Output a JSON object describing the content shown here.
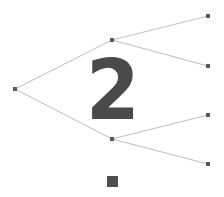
{
  "diagram": {
    "type": "binary-tree",
    "center_label": "2",
    "colors": {
      "edge": "#bdbdbd",
      "node": "#5a5a5a",
      "label": "#4a4a4a",
      "square": "#4f4f4f",
      "background": "#ffffff"
    },
    "nodes": [
      {
        "id": "root",
        "x": 15,
        "y": 89
      },
      {
        "id": "mid-top",
        "x": 112,
        "y": 40
      },
      {
        "id": "mid-bottom",
        "x": 112,
        "y": 139
      },
      {
        "id": "leaf-1",
        "x": 208,
        "y": 16
      },
      {
        "id": "leaf-2",
        "x": 208,
        "y": 66
      },
      {
        "id": "leaf-3",
        "x": 208,
        "y": 115
      },
      {
        "id": "leaf-4",
        "x": 208,
        "y": 164
      }
    ],
    "edges": [
      [
        "root",
        "mid-top"
      ],
      [
        "root",
        "mid-bottom"
      ],
      [
        "mid-top",
        "leaf-1"
      ],
      [
        "mid-top",
        "leaf-2"
      ],
      [
        "mid-bottom",
        "leaf-3"
      ],
      [
        "mid-bottom",
        "leaf-4"
      ]
    ]
  }
}
